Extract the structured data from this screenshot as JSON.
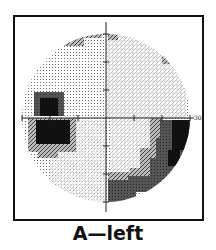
{
  "figure": {
    "caption": "A—left",
    "type": "visual-field-greyscale-plot",
    "eye": "left",
    "axis_label_right": "30"
  },
  "layout": {
    "center": [
      106,
      118
    ],
    "radius_px": 84,
    "cell_px": 6,
    "frame": {
      "x": 13,
      "y": 15,
      "w": 189,
      "h": 204
    },
    "tick_spacing_px": 28
  },
  "shading_levels": {
    "0": "#ffffff",
    "1": "#e4e4e4",
    "2": "#bdbdbd",
    "3": "#7a7a7a",
    "4": "#444444",
    "5": "#0e0e0e"
  },
  "regions": [
    {
      "name": "superior-arcuate-defect-left",
      "level": 3,
      "rects": [
        [
          74,
          30,
          28,
          8
        ],
        [
          52,
          38,
          32,
          8
        ],
        [
          64,
          42,
          20,
          4
        ]
      ]
    },
    {
      "name": "superior-spot-right",
      "level": 3,
      "rects": [
        [
          108,
          28,
          10,
          12
        ]
      ]
    },
    {
      "name": "superior-peripheral-spot-right",
      "level": 3,
      "rects": [
        [
          162,
          52,
          12,
          12
        ]
      ]
    },
    {
      "name": "blind-spot-upper",
      "level": 4,
      "rects": [
        [
          34,
          92,
          30,
          24
        ]
      ]
    },
    {
      "name": "blind-spot-core-upper",
      "level": 5,
      "rects": [
        [
          40,
          98,
          18,
          18
        ]
      ]
    },
    {
      "name": "blind-spot-lower",
      "level": 5,
      "rects": [
        [
          36,
          120,
          34,
          24
        ]
      ]
    },
    {
      "name": "blind-spot-lower-fringe",
      "level": 3,
      "rects": [
        [
          28,
          118,
          48,
          34
        ],
        [
          38,
          150,
          20,
          8
        ]
      ]
    },
    {
      "name": "inferior-nasal-step-outer",
      "level": 4,
      "rects": [
        [
          160,
          120,
          30,
          18
        ],
        [
          156,
          138,
          28,
          20
        ],
        [
          150,
          158,
          28,
          20
        ],
        [
          142,
          178,
          24,
          14
        ]
      ]
    },
    {
      "name": "inferior-nasal-step-inner",
      "level": 5,
      "rects": [
        [
          172,
          120,
          18,
          30
        ],
        [
          168,
          150,
          12,
          16
        ]
      ]
    },
    {
      "name": "inferior-arcuate-middle",
      "level": 3,
      "rects": [
        [
          150,
          118,
          12,
          30
        ],
        [
          140,
          148,
          16,
          22
        ],
        [
          130,
          168,
          22,
          12
        ]
      ]
    },
    {
      "name": "inferior-arcuate-dark",
      "level": 4,
      "rects": [
        [
          128,
          176,
          24,
          16
        ]
      ]
    },
    {
      "name": "inferior-central-dense",
      "level": 4,
      "rects": [
        [
          108,
          180,
          28,
          22
        ]
      ]
    },
    {
      "name": "inferior-central-fringe",
      "level": 3,
      "rects": [
        [
          108,
          172,
          28,
          8
        ]
      ]
    }
  ]
}
